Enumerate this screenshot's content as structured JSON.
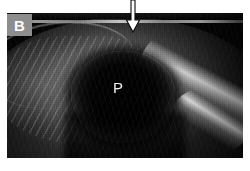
{
  "figure": {
    "panel_label": "B",
    "modality": "ultrasound",
    "image_kind": "grayscale-b-mode-sonogram",
    "background_color": "#ffffff"
  },
  "labels": {
    "panel": {
      "text": "B",
      "box_color": "#8d8d8d",
      "text_color": "#ffffff"
    },
    "structure_marker": {
      "text": "P",
      "text_color": "#f2f2f2"
    }
  },
  "annotations": {
    "arrow": {
      "icon": "down-arrow-icon",
      "style": "hollow-outlined",
      "direction": "down",
      "stroke_color": "#000000",
      "fill_color": "#ffffff"
    }
  },
  "image_regions": {
    "top_interface": "bright-skin-line",
    "central_structure": "hypoechoic-oval",
    "right_edge": "bright-capsule-reflector",
    "left_field": "striated-hyperechoic-tissue"
  }
}
